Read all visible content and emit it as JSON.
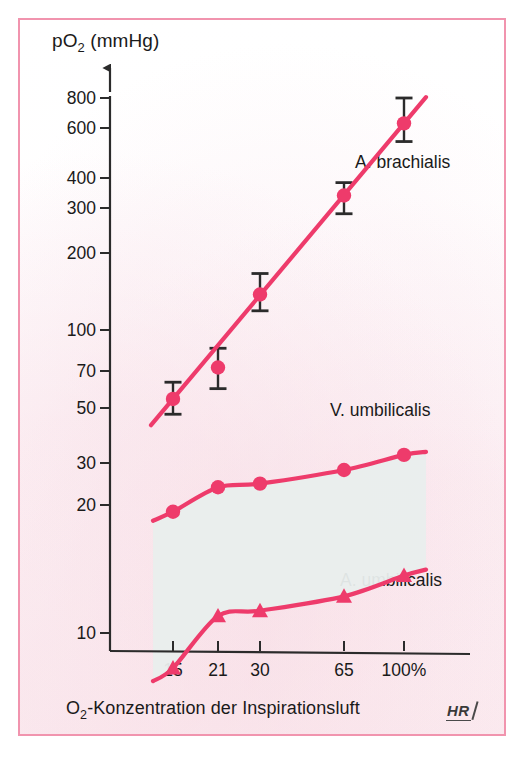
{
  "figure": {
    "y_axis_title": "pO",
    "y_axis_title_sub": "2",
    "y_axis_title_unit": " (mmHg)",
    "x_axis_title_lead": "O",
    "x_axis_title_sub": "2",
    "x_axis_title_rest": "-Konzentration der Inspirationsluft",
    "credit": "HR"
  },
  "colors": {
    "accent_pink": "#ee3b6b",
    "frame_pink": "#f194ae",
    "band_fill": "#e9eeed",
    "axis_black": "#2b2b2b"
  },
  "chart_data": {
    "type": "line",
    "title": "",
    "xlabel": "O2-Konzentration der Inspirationsluft",
    "ylabel": "pO2 (mmHg)",
    "yscale": "log",
    "ylim": [
      9,
      900
    ],
    "grid": false,
    "legend_position": "inline-right",
    "categories": [
      "15",
      "21",
      "30",
      "65",
      "100%"
    ],
    "x_tick_labels": [
      "15",
      "21",
      "30",
      "65",
      "100%"
    ],
    "y_tick_labels": [
      "10",
      "20",
      "30",
      "50",
      "70",
      "100",
      "200",
      "300",
      "400",
      "600",
      "800"
    ],
    "y_tick_values": [
      10,
      20,
      30,
      50,
      70,
      100,
      200,
      300,
      400,
      600,
      800
    ],
    "series": [
      {
        "name": "A. brachialis",
        "marker": "circle",
        "values": [
          68,
          88,
          160,
          360,
          650
        ],
        "error_low": [
          60,
          74,
          140,
          310,
          560
        ],
        "error_high": [
          78,
          103,
          190,
          400,
          800
        ]
      },
      {
        "name": "V. umbilicalis",
        "marker": "circle",
        "values": [
          27,
          33,
          34,
          38,
          43
        ],
        "error_low": [],
        "error_high": []
      },
      {
        "name": "A. umbilicalis",
        "marker": "triangle",
        "values": [
          7.5,
          11.5,
          12,
          13.5,
          16
        ],
        "error_low": [],
        "error_high": []
      }
    ],
    "shaded_band": {
      "between": [
        "V. umbilicalis",
        "A. umbilicalis"
      ],
      "fill": "#e9eeed"
    }
  },
  "y_ticks": [
    {
      "label": "800",
      "y": 98
    },
    {
      "label": "600",
      "y": 128
    },
    {
      "label": "400",
      "y": 178
    },
    {
      "label": "300",
      "y": 208
    },
    {
      "label": "200",
      "y": 253
    },
    {
      "label": "100",
      "y": 330
    },
    {
      "label": "70",
      "y": 371
    },
    {
      "label": "50",
      "y": 408
    },
    {
      "label": "30",
      "y": 463
    },
    {
      "label": "20",
      "y": 505
    },
    {
      "label": "10",
      "y": 633
    }
  ],
  "x_ticks": [
    {
      "label": "15",
      "x": 173
    },
    {
      "label": "21",
      "x": 218
    },
    {
      "label": "30",
      "x": 260
    },
    {
      "label": "65",
      "x": 344
    },
    {
      "label": "100%",
      "x": 404
    }
  ],
  "series_labels": [
    {
      "name": "A. brachialis",
      "x": 355,
      "y": 152
    },
    {
      "name": "V. umbilicalis",
      "x": 330,
      "y": 400
    },
    {
      "name": "A. umbilicalis",
      "x": 340,
      "y": 570
    }
  ]
}
